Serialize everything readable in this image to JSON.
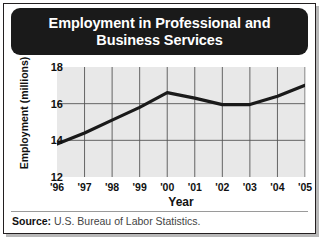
{
  "figure": {
    "title": "Employment in Professional and Business Services",
    "source_label": "Source:",
    "source_value": "U.S. Bureau of Labor Statistics."
  },
  "colors": {
    "banner_background": "#1a1a1a",
    "banner_text": "#ffffff",
    "plot_background": "#e8e8e8",
    "grid_line": "#555555",
    "data_line": "#1a1a1a",
    "frame_border": "#231f20"
  },
  "chart_data": {
    "type": "line",
    "title": "Employment in Professional and Business Services",
    "xlabel": "Year",
    "ylabel": "Employment (millions)",
    "categories": [
      "'96",
      "'97",
      "'98",
      "'99",
      "'00",
      "'01",
      "'02",
      "'03",
      "'04",
      "'05"
    ],
    "x": [
      1996,
      1997,
      1998,
      1999,
      2000,
      2001,
      2002,
      2003,
      2004,
      2005
    ],
    "values": [
      13.8,
      14.4,
      15.1,
      15.8,
      16.6,
      16.3,
      15.95,
      15.95,
      16.4,
      17.0
    ],
    "ylim": [
      12,
      18
    ],
    "xlim": [
      1996,
      2005
    ],
    "yticks": [
      12,
      14,
      16,
      18
    ],
    "ytick_labels": [
      "12",
      "14",
      "16",
      "18"
    ],
    "grid": true,
    "legend": false,
    "series": [
      {
        "name": "Employment in Professional and Business Services",
        "values": [
          13.8,
          14.4,
          15.1,
          15.8,
          16.6,
          16.3,
          15.95,
          15.95,
          16.4,
          17.0
        ]
      }
    ]
  }
}
